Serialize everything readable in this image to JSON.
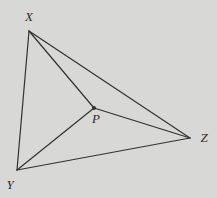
{
  "figure": {
    "background_color": "#d8d8d6",
    "line_color": "#33322f",
    "label_color": "#2e2d2a",
    "line_width": 1.2,
    "width": 217,
    "height": 198,
    "points": [
      {
        "id": "X",
        "label": "X",
        "x": 29,
        "y": 31,
        "label_x": 29,
        "label_y": 21,
        "dot": false
      },
      {
        "id": "Y",
        "label": "Y",
        "x": 17,
        "y": 170,
        "label_x": 10,
        "label_y": 189,
        "dot": false
      },
      {
        "id": "Z",
        "label": "Z",
        "x": 190,
        "y": 138,
        "label_x": 204,
        "label_y": 142,
        "dot": false
      },
      {
        "id": "P",
        "label": "P",
        "x": 94,
        "y": 108,
        "label_x": 96,
        "label_y": 123,
        "dot": true,
        "dot_radius": 2
      }
    ],
    "edges": [
      {
        "from": "X",
        "to": "Y"
      },
      {
        "from": "Y",
        "to": "Z"
      },
      {
        "from": "X",
        "to": "Z"
      },
      {
        "from": "X",
        "to": "P"
      },
      {
        "from": "Y",
        "to": "P"
      },
      {
        "from": "Z",
        "to": "P"
      }
    ]
  }
}
